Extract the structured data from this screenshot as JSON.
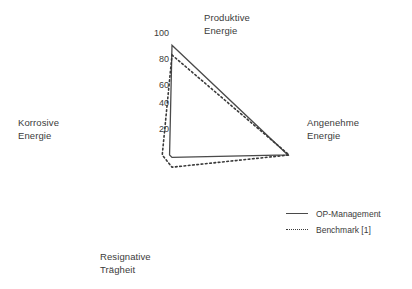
{
  "chart_data": {
    "type": "line",
    "subtype": "radar",
    "title": "",
    "xlabel": "",
    "ylabel": "",
    "categories": [
      "Produktive Energie",
      "Angenehme Energie",
      "Resignative Trägheit",
      "Korrosive Energie"
    ],
    "category_positions": [
      "top",
      "right",
      "bottom",
      "left"
    ],
    "radial_ticks": [
      100,
      80,
      60,
      40,
      20
    ],
    "radial_tick_labels": [
      "100",
      "80",
      "60",
      "40",
      "20"
    ],
    "rlim": [
      0,
      100
    ],
    "grid": false,
    "legend_position": "bottom-right",
    "series": [
      {
        "name": "OP-Management",
        "style": "solid",
        "color": "#4a4a4a",
        "values": [
          90,
          95,
          2,
          2
        ]
      },
      {
        "name": "Benchmark [1]",
        "style": "dotted",
        "color": "#3a3a3a",
        "values": [
          82,
          96,
          10,
          8
        ]
      }
    ]
  },
  "axis_labels": {
    "top": "Produktive\nEnergie",
    "right": "Angenehme\nEnergie",
    "bottom": "Resignative\nTrägheit",
    "left": "Korrosive\nEnergie"
  },
  "ticks": {
    "t100": "100",
    "t80": "80",
    "t60": "60",
    "t40": "40",
    "t20": "20"
  },
  "legend": {
    "items": [
      {
        "label": "OP-Management",
        "style": "solid"
      },
      {
        "label": "Benchmark [1]",
        "style": "dotted"
      }
    ]
  }
}
